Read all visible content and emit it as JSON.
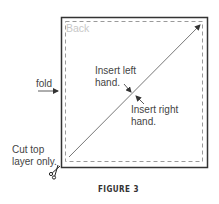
{
  "diagram": {
    "panel_label": "Back",
    "fold_label": "fold",
    "left_hand_label": [
      "Insert left",
      "hand."
    ],
    "right_hand_label": [
      "Insert right",
      "hand."
    ],
    "cut_label": [
      "Cut top",
      "layer only."
    ],
    "caption": "FIGURE 3",
    "icons": [
      "scissors-icon",
      "arrow-right-icon",
      "arrow-icon"
    ],
    "colors": {
      "border": "#333333",
      "dashed": "#9a9a9a",
      "text": "#444444",
      "back_text": "#c8c8c8"
    }
  }
}
